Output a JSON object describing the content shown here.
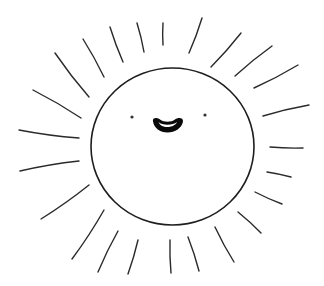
{
  "illustration": {
    "subject": "Smiling sun line drawing",
    "style": "hand-drawn black ink on white",
    "colors": {
      "background": "#ffffff",
      "ink": "#1e1e1e",
      "mouth_fill": "#0a0a0a"
    },
    "sun": {
      "center": [
        172.5,
        146.5
      ],
      "rx": 81.5,
      "ry": 78.5
    },
    "face": {
      "left_eye": [
        132,
        117
      ],
      "right_eye": [
        205,
        115
      ],
      "mouth": {
        "x_range": [
          152,
          183
        ],
        "y_range": [
          118,
          132
        ],
        "expression": "open smile"
      }
    },
    "rays": [
      {
        "x1": 137,
        "y1": 23,
        "x2": 144,
        "y2": 52
      },
      {
        "x1": 163,
        "y1": 23,
        "x2": 163,
        "y2": 45
      },
      {
        "x1": 202,
        "y1": 18,
        "x2": 189,
        "y2": 53
      },
      {
        "x1": 110,
        "y1": 27,
        "x2": 123,
        "y2": 62
      },
      {
        "x1": 83,
        "y1": 39,
        "x2": 104,
        "y2": 77
      },
      {
        "x1": 55,
        "y1": 53,
        "x2": 89,
        "y2": 97
      },
      {
        "x1": 33,
        "y1": 90,
        "x2": 81,
        "y2": 118
      },
      {
        "x1": 19,
        "y1": 130,
        "x2": 79,
        "y2": 138
      },
      {
        "x1": 241,
        "y1": 33,
        "x2": 211,
        "y2": 67
      },
      {
        "x1": 272,
        "y1": 46,
        "x2": 235,
        "y2": 76
      },
      {
        "x1": 298,
        "y1": 65,
        "x2": 254,
        "y2": 88
      },
      {
        "x1": 309,
        "y1": 105,
        "x2": 263,
        "y2": 116
      },
      {
        "x1": 20,
        "y1": 171,
        "x2": 79,
        "y2": 161
      },
      {
        "x1": 41,
        "y1": 219,
        "x2": 89,
        "y2": 185
      },
      {
        "x1": 104,
        "y1": 210,
        "x2": 72,
        "y2": 259
      },
      {
        "x1": 118,
        "y1": 231,
        "x2": 98,
        "y2": 272
      },
      {
        "x1": 138,
        "y1": 240,
        "x2": 128,
        "y2": 274
      },
      {
        "x1": 270,
        "y1": 147,
        "x2": 303,
        "y2": 148
      },
      {
        "x1": 267,
        "y1": 172,
        "x2": 291,
        "y2": 177
      },
      {
        "x1": 255,
        "y1": 192,
        "x2": 282,
        "y2": 204
      },
      {
        "x1": 238,
        "y1": 212,
        "x2": 261,
        "y2": 233
      },
      {
        "x1": 215,
        "y1": 227,
        "x2": 234,
        "y2": 262
      },
      {
        "x1": 188,
        "y1": 237,
        "x2": 199,
        "y2": 271
      },
      {
        "x1": 170,
        "y1": 240,
        "x2": 171,
        "y2": 273
      }
    ]
  }
}
